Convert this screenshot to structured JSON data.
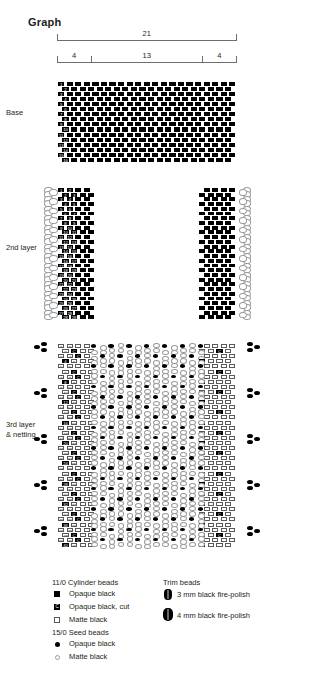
{
  "title": "Graph",
  "ruler": {
    "total_label": "21",
    "segments": [
      {
        "label": "4",
        "units": 4
      },
      {
        "label": "13",
        "units": 13
      },
      {
        "label": "4",
        "units": 4
      }
    ]
  },
  "sections": [
    {
      "id": "base",
      "label": "Base",
      "label_lines": [
        "Base"
      ],
      "description": "Solid brick-stitch panel of opaque black cylinder beads, 21 columns wide by 16 rows tall, numbered 1-16 in the first two columns.",
      "columns": 21,
      "rows": 16,
      "numbered_beads": [
        "1",
        "2",
        "3",
        "4",
        "5",
        "6",
        "7",
        "8",
        "9",
        "10",
        "11",
        "12",
        "13",
        "14",
        "15",
        "16"
      ]
    },
    {
      "id": "second-layer",
      "label": "2nd layer",
      "label_lines": [
        "2nd layer"
      ],
      "description": "Two separate side panels of opaque black cylinder beads, 4 columns wide by 28 rows tall, with matte black 15/0 seed-bead picot loops along the outer edge. Centre 13 columns are empty.",
      "columns_per_side": 4,
      "rows": 28,
      "numbered_beads": [
        "1",
        "2",
        "3",
        "4",
        "5",
        "6",
        "7",
        "8",
        "9",
        "10",
        "11",
        "12",
        "13",
        "14",
        "15",
        "16",
        "17",
        "18",
        "19",
        "20",
        "21",
        "22",
        "23",
        "24",
        "25",
        "26",
        "27",
        "28"
      ]
    },
    {
      "id": "third-layer",
      "label": "3rd layer & netting",
      "label_lines": [
        "3rd layer",
        "& netting"
      ],
      "description": "Side panels mixing matte black and opaque black cut cylinder beads, 40 rows tall, numbered 1-40; centre filled with a diamond netting of matte black 15/0 seed beads accented with opaque black 15/0 seed beads; fire-polish trim bead clusters along both outer edges.",
      "rows": 40,
      "numbered_beads": [
        "1",
        "2",
        "3",
        "4",
        "5",
        "6",
        "7",
        "8",
        "9",
        "10",
        "11",
        "12",
        "13",
        "14",
        "15",
        "16",
        "17",
        "18",
        "19",
        "20",
        "21",
        "22",
        "23",
        "24",
        "25",
        "26",
        "27",
        "28",
        "29",
        "30",
        "31",
        "32",
        "33",
        "34",
        "35",
        "36",
        "37",
        "38",
        "39",
        "40"
      ],
      "cut_bead_marker": "C"
    }
  ],
  "legend": {
    "groups": [
      {
        "id": "cylinder-beads",
        "heading": "11/0 Cylinder beads",
        "items": [
          {
            "swatch": "square-black",
            "marker": "",
            "label": "Opaque black"
          },
          {
            "swatch": "square-cut",
            "marker": "C",
            "label": "Opaque black, cut"
          },
          {
            "swatch": "square-matte",
            "marker": "",
            "label": "Matte black"
          }
        ]
      },
      {
        "id": "seed-beads",
        "heading": "15/0 Seed beads",
        "items": [
          {
            "swatch": "dot-black",
            "marker": "",
            "label": "Opaque black"
          },
          {
            "swatch": "dot-matte",
            "marker": "",
            "label": "Matte black"
          }
        ]
      },
      {
        "id": "trim-beads",
        "heading": "Trim beads",
        "items": [
          {
            "swatch": "fire-polish-3",
            "marker": "",
            "label": "3 mm black fire-polish"
          },
          {
            "swatch": "fire-polish-4",
            "marker": "",
            "label": "4 mm black fire-polish"
          }
        ]
      }
    ]
  },
  "colors": {
    "opaque_black": "#000000",
    "matte_black_fill": "#ffffff",
    "matte_black_outline": "#58595b",
    "seed_matte_outline": "#9a9b9d",
    "rule_gray": "#6d6e71",
    "text": "#231f20"
  }
}
